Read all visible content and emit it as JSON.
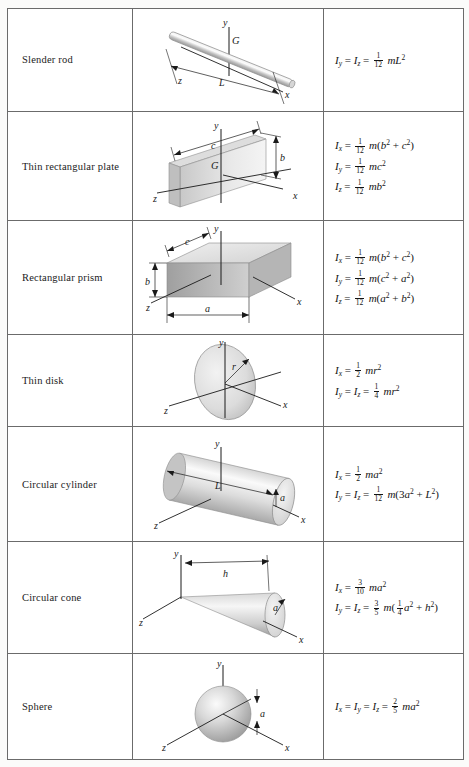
{
  "table": {
    "caption": "Mass Moments of Inertia of Common Geometric Shapes",
    "columns": [
      "Shape",
      "Figure",
      "Moments of inertia"
    ],
    "rows": [
      {
        "name": "Slender rod",
        "figure": "slender-rod",
        "axes": [
          "x",
          "y",
          "z"
        ],
        "dimensions": [
          "L"
        ],
        "centroid_label": "G",
        "formulas": [
          {
            "lhs": [
              "I_y",
              "I_z"
            ],
            "coefficient": "1/12",
            "expression": "mL^2",
            "display": "I_y = I_z = (1/12) m L^2"
          }
        ]
      },
      {
        "name": "Thin rectangular plate",
        "figure": "thin-rectangular-plate",
        "axes": [
          "x",
          "y",
          "z"
        ],
        "dimensions": [
          "b",
          "c"
        ],
        "centroid_label": "G",
        "formulas": [
          {
            "lhs": [
              "I_x"
            ],
            "coefficient": "1/12",
            "expression": "m(b^2 + c^2)",
            "display": "I_x = (1/12) m(b^2 + c^2)"
          },
          {
            "lhs": [
              "I_y"
            ],
            "coefficient": "1/12",
            "expression": "mc^2",
            "display": "I_y = (1/12) m c^2"
          },
          {
            "lhs": [
              "I_z"
            ],
            "coefficient": "1/12",
            "expression": "mb^2",
            "display": "I_z = (1/12) m b^2"
          }
        ]
      },
      {
        "name": "Rectangular prism",
        "figure": "rectangular-prism",
        "axes": [
          "x",
          "y",
          "z"
        ],
        "dimensions": [
          "a",
          "b",
          "c"
        ],
        "centroid_label": "",
        "formulas": [
          {
            "lhs": [
              "I_x"
            ],
            "coefficient": "1/12",
            "expression": "m(b^2 + c^2)",
            "display": "I_x = (1/12) m(b^2 + c^2)"
          },
          {
            "lhs": [
              "I_y"
            ],
            "coefficient": "1/12",
            "expression": "m(c^2 + a^2)",
            "display": "I_y = (1/12) m(c^2 + a^2)"
          },
          {
            "lhs": [
              "I_z"
            ],
            "coefficient": "1/12",
            "expression": "m(a^2 + b^2)",
            "display": "I_z = (1/12) m(a^2 + b^2)"
          }
        ]
      },
      {
        "name": "Thin disk",
        "figure": "thin-disk",
        "axes": [
          "x",
          "y",
          "z"
        ],
        "dimensions": [
          "r"
        ],
        "centroid_label": "",
        "formulas": [
          {
            "lhs": [
              "I_x"
            ],
            "coefficient": "1/2",
            "expression": "mr^2",
            "display": "I_x = (1/2) m r^2"
          },
          {
            "lhs": [
              "I_y",
              "I_z"
            ],
            "coefficient": "1/4",
            "expression": "mr^2",
            "display": "I_y = I_z = (1/4) m r^2"
          }
        ]
      },
      {
        "name": "Circular cylinder",
        "figure": "circular-cylinder",
        "axes": [
          "x",
          "y",
          "z"
        ],
        "dimensions": [
          "a",
          "L"
        ],
        "centroid_label": "",
        "formulas": [
          {
            "lhs": [
              "I_x"
            ],
            "coefficient": "1/2",
            "expression": "ma^2",
            "display": "I_x = (1/2) m a^2"
          },
          {
            "lhs": [
              "I_y",
              "I_z"
            ],
            "coefficient": "1/12",
            "expression": "m(3a^2 + L^2)",
            "display": "I_y = I_z = (1/12) m(3a^2 + L^2)"
          }
        ]
      },
      {
        "name": "Circular cone",
        "figure": "circular-cone",
        "axes": [
          "x",
          "y",
          "z"
        ],
        "dimensions": [
          "a",
          "h"
        ],
        "centroid_label": "",
        "formulas": [
          {
            "lhs": [
              "I_x"
            ],
            "coefficient": "3/10",
            "expression": "ma^2",
            "display": "I_x = (3/10) m a^2"
          },
          {
            "lhs": [
              "I_y",
              "I_z"
            ],
            "coefficient": "3/5",
            "expression": "m((1/4)a^2 + h^2)",
            "display": "I_y = I_z = (3/5) m((1/4)a^2 + h^2)"
          }
        ]
      },
      {
        "name": "Sphere",
        "figure": "sphere",
        "axes": [
          "x",
          "y",
          "z"
        ],
        "dimensions": [
          "a"
        ],
        "centroid_label": "",
        "formulas": [
          {
            "lhs": [
              "I_x",
              "I_y",
              "I_z"
            ],
            "coefficient": "2/5",
            "expression": "ma^2",
            "display": "I_x = I_y = I_z = (2/5) m a^2"
          }
        ]
      }
    ]
  },
  "symbols": {
    "I": "I",
    "m": "m",
    "L": "L",
    "a": "a",
    "b": "b",
    "c": "c",
    "r": "r",
    "h": "h",
    "x": "x",
    "y": "y",
    "z": "z",
    "G": "G"
  },
  "colors": {
    "border": "#6b6b6b",
    "page_bg": "#fbfbfa",
    "cell_bg": "#ffffff",
    "text": "#1a1a1a",
    "shape_light": "#e6e6e6",
    "shape_mid": "#c9c9c9",
    "shape_dark": "#a8a8a8"
  }
}
